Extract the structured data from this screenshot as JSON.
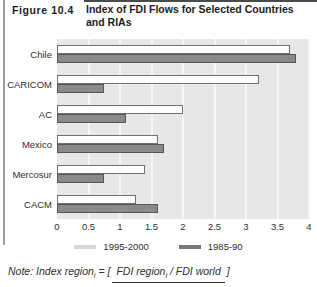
{
  "header": {
    "figure_label": "Figure 10.4",
    "title": "Index of FDI Flows for Selected Countries and RIAs"
  },
  "chart_data": {
    "type": "bar",
    "orientation": "horizontal",
    "title": "Index of FDI Flows for Selected Countries and RIAs",
    "categories": [
      "Chile",
      "CARICOM",
      "AC",
      "Mexico",
      "Mercosur",
      "CACM"
    ],
    "series": [
      {
        "name": "1995-2000",
        "color": "#fdfdfd",
        "values": [
          3.7,
          3.2,
          2.0,
          1.6,
          1.4,
          1.25
        ]
      },
      {
        "name": "1985-90",
        "color": "#8a8a8a",
        "values": [
          3.8,
          0.75,
          1.1,
          1.7,
          0.75,
          1.6
        ]
      }
    ],
    "xlim": [
      0,
      4
    ],
    "xticks": [
      0,
      0.5,
      1,
      1.5,
      2,
      2.5,
      3,
      3.5,
      4
    ],
    "xtick_labels": [
      "0",
      "0.5",
      "1",
      "1.5",
      "2",
      "2.5",
      "3",
      "3.5",
      "4"
    ],
    "grid": "vertical-light",
    "legend_position": "bottom",
    "plot_bg": "#e7e7e7"
  },
  "legend": [
    {
      "label": "1995-2000",
      "swatch_color": "#d6d6d6"
    },
    {
      "label": "1985-90",
      "swatch_color": "#7a7a7a"
    }
  ],
  "note": {
    "label": "Note:",
    "lhs": "Index region",
    "lhs_sub": "i",
    "equals": " = ",
    "bracket_open": "[",
    "numerator_a": "FDI region",
    "numerator_sub": "i",
    "numerator_b": " / FDI world",
    "bracket_close": "]"
  }
}
